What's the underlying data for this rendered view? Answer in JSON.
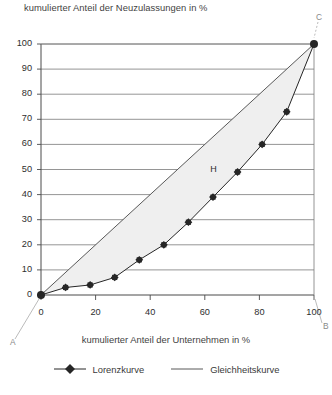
{
  "chart_data": {
    "type": "line",
    "title": "",
    "ylabel": "kumulierter Anteil der Neuzulassungen in %",
    "xlabel": "kumulierter Anteil der Unternehmen in %",
    "xlim": [
      0,
      100
    ],
    "ylim": [
      0,
      100
    ],
    "grid": "horizontal",
    "legend_position": "bottom",
    "xticks": [
      "0",
      "20",
      "40",
      "60",
      "80",
      "100"
    ],
    "xtick_values": [
      0,
      20,
      40,
      60,
      80,
      100
    ],
    "yticks": [
      "0",
      "10",
      "20",
      "30",
      "40",
      "50",
      "60",
      "70",
      "80",
      "90",
      "100"
    ],
    "ytick_values": [
      0,
      10,
      20,
      30,
      40,
      50,
      60,
      70,
      80,
      90,
      100
    ],
    "series": [
      {
        "name": "Lorenzkurve",
        "marker": "diamond",
        "color": "#262626",
        "x": [
          0,
          9,
          18,
          27,
          36,
          45,
          54,
          63,
          72,
          81,
          90,
          100
        ],
        "y": [
          0,
          3,
          4,
          7,
          14,
          20,
          29,
          39,
          49,
          60,
          73,
          100
        ]
      },
      {
        "name": "Gleichheitskurve",
        "marker": "none",
        "color": "#595959",
        "x": [
          0,
          100
        ],
        "y": [
          0,
          100
        ]
      }
    ],
    "annotations": [
      {
        "text": "C",
        "x": 100,
        "y": 100,
        "position": "top-right",
        "color": "#8a8a8a"
      },
      {
        "text": "A",
        "x": 0,
        "y": 0,
        "position": "bottom-left",
        "color": "#8a8a8a"
      },
      {
        "text": "B",
        "x": 100,
        "y": 0,
        "position": "bottom-right",
        "color": "#8a8a8a"
      },
      {
        "text": "H",
        "x": 62,
        "y": 52,
        "position": "inside",
        "color": "#2e2e2e"
      }
    ],
    "shaded_region": {
      "label": "H",
      "fill": "#efefef",
      "between": [
        "Gleichheitskurve",
        "Lorenzkurve"
      ]
    }
  },
  "legend": {
    "items": [
      {
        "label": "Lorenzkurve",
        "marker": "diamond-line"
      },
      {
        "label": "Gleichheitskurve",
        "marker": "line"
      }
    ]
  },
  "colors": {
    "axis": "#4a4a4a",
    "gridline": "#7a7a7a",
    "lorenz": "#262626",
    "equality": "#595959",
    "shade": "#efefef",
    "leader": "#a9a9a9",
    "text": "#3a3a3a"
  }
}
